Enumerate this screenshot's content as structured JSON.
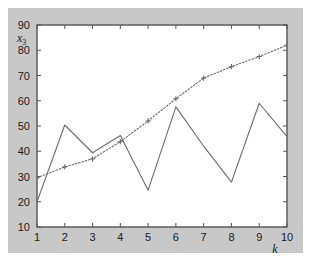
{
  "figure": {
    "background_color": "#c8c8c8",
    "plot_background_color": "#ffffff",
    "axis_color": "#555555"
  },
  "chart_data": {
    "type": "line",
    "title": "",
    "subtitle": "",
    "xlabel": "k",
    "ylabel": "x",
    "ylabel_subscript": "3",
    "xlim": [
      1,
      10
    ],
    "ylim": [
      10,
      90
    ],
    "xticks": [
      1,
      2,
      3,
      4,
      5,
      6,
      7,
      8,
      9,
      10
    ],
    "xticklabels": [
      "1",
      "2",
      "3",
      "4",
      "5",
      "6",
      "7",
      "8",
      "9",
      "10"
    ],
    "yticks": [
      10,
      20,
      30,
      40,
      50,
      60,
      70,
      80,
      90
    ],
    "yticklabels": [
      "10",
      "20",
      "30",
      "40",
      "50",
      "60",
      "70",
      "80",
      "90"
    ],
    "grid": false,
    "legend": null,
    "x": [
      1,
      2,
      3,
      4,
      5,
      6,
      7,
      8,
      9,
      10
    ],
    "series": [
      {
        "name": "measured",
        "style": "solid",
        "marker": "none",
        "color": "#6b6b6b",
        "values": [
          20.0,
          50.4,
          39.4,
          46.2,
          24.6,
          57.6,
          42.0,
          27.8,
          59.0,
          45.8
        ]
      },
      {
        "name": "estimate",
        "style": "dotted",
        "marker": "plus",
        "color": "#6b6b6b",
        "values": [
          29.5,
          33.8,
          37.0,
          43.8,
          52.0,
          60.8,
          69.0,
          73.5,
          77.5,
          82.0
        ]
      }
    ]
  }
}
